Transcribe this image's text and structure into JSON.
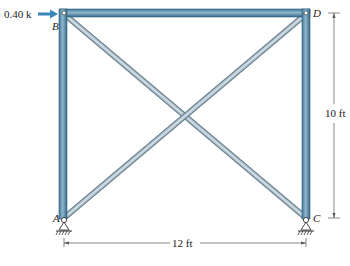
{
  "figure": {
    "load": {
      "label": "0.40 k",
      "direction": "right",
      "at_node": "B"
    },
    "nodes": {
      "A": "A",
      "B": "B",
      "C": "C",
      "D": "D"
    },
    "dimensions": {
      "height": "10 ft",
      "width": "12 ft"
    },
    "members": [
      {
        "name": "AB",
        "type": "column"
      },
      {
        "name": "CD",
        "type": "column"
      },
      {
        "name": "BD",
        "type": "beam"
      },
      {
        "name": "BC",
        "type": "brace"
      },
      {
        "name": "AD",
        "type": "brace"
      }
    ],
    "supports": [
      {
        "node": "A",
        "type": "pin"
      },
      {
        "node": "C",
        "type": "pin"
      }
    ],
    "caption": "",
    "colors": {
      "member_dark": "#3f7596",
      "member_light": "#8fb6cc",
      "brace_dark": "#8a9aa6",
      "brace_light": "#d5dde3",
      "load_arrow": "#3a86b8"
    }
  }
}
